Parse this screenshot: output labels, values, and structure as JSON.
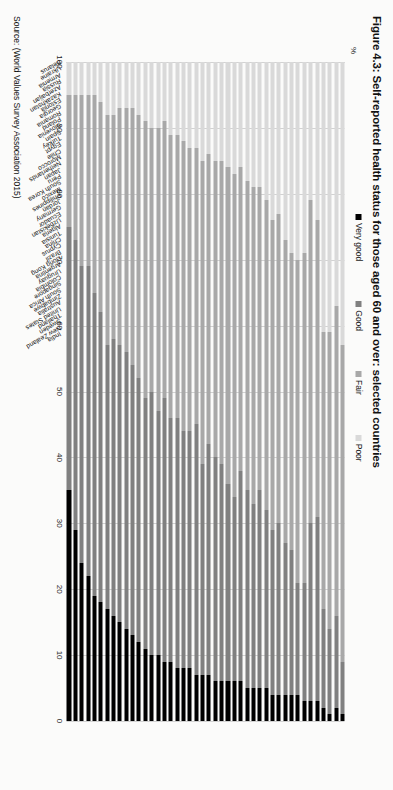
{
  "figure": {
    "title": "Figure 4.3: Self-reported health status for those aged 60 and over: selected countries",
    "source": "Source: (World Values Survey Association 2015)",
    "axis_unit_label": "%"
  },
  "legend": {
    "items": [
      {
        "label": "Very good",
        "color": "#000000"
      },
      {
        "label": "Good",
        "color": "#808080"
      },
      {
        "label": "Fair",
        "color": "#a8a8a8"
      },
      {
        "label": "Poor",
        "color": "#d9d9d9"
      }
    ]
  },
  "chart_data": {
    "type": "bar",
    "orientation": "horizontal-stacked-100",
    "title": "Figure 4.3: Self-reported health status for those aged 60 and over: selected countries",
    "xlabel": "%",
    "ylabel": "",
    "xlim": [
      0,
      100
    ],
    "xticks": [
      100,
      90,
      80,
      70,
      60,
      50,
      40,
      30,
      20,
      10,
      0
    ],
    "x_axis_direction": "reversed",
    "grid": true,
    "legend_position": "top",
    "categories": [
      "Belarus",
      "Ukraine",
      "Armenia",
      "Russia",
      "Azerbaijan",
      "Kazakhstan",
      "Estonia",
      "Georgia",
      "Romania",
      "Poland",
      "Slovenia",
      "Spain",
      "Turkey",
      "Egypt",
      "Chile",
      "Morocco",
      "Netherlands",
      "Japan",
      "Peru",
      "South Korea",
      "Mexico",
      "Philippines",
      "Jordan",
      "Germany",
      "Ecuador",
      "Uzbekistan",
      "Algeria",
      "Tunisia",
      "China",
      "Cyprus",
      "Brazil",
      "Hong Kong",
      "Argentina",
      "Uruguay",
      "Colombia",
      "Singapore",
      "South Africa",
      "Zimbabwe",
      "Australia",
      "United States",
      "Thailand",
      "Sweden",
      "New Zealand",
      "India"
    ],
    "series": [
      {
        "name": "Very good",
        "color": "#000000",
        "values": [
          1,
          2,
          1,
          2,
          3,
          3,
          3,
          4,
          4,
          4,
          4,
          4,
          5,
          5,
          5,
          5,
          6,
          6,
          6,
          6,
          6,
          7,
          7,
          7,
          8,
          8,
          8,
          9,
          9,
          10,
          10,
          11,
          12,
          13,
          14,
          15,
          16,
          17,
          18,
          19,
          22,
          24,
          29,
          35
        ]
      },
      {
        "name": "Good",
        "color": "#808080",
        "values": [
          8,
          14,
          13,
          15,
          28,
          27,
          18,
          17,
          22,
          23,
          26,
          25,
          27,
          30,
          28,
          30,
          32,
          28,
          30,
          33,
          34,
          35,
          32,
          38,
          36,
          36,
          38,
          37,
          40,
          37,
          40,
          38,
          40,
          41,
          42,
          42,
          42,
          40,
          44,
          46,
          47,
          45,
          44,
          40
        ]
      },
      {
        "name": "Fair",
        "color": "#a8a8a8",
        "values": [
          48,
          47,
          45,
          42,
          45,
          49,
          50,
          49,
          45,
          46,
          47,
          47,
          47,
          46,
          48,
          47,
          46,
          49,
          48,
          46,
          45,
          44,
          46,
          42,
          43,
          44,
          43,
          43,
          42,
          43,
          40,
          42,
          40,
          39,
          37,
          36,
          34,
          35,
          32,
          30,
          26,
          26,
          22,
          20
        ]
      },
      {
        "name": "Poor",
        "color": "#d9d9d9",
        "values": [
          43,
          37,
          41,
          41,
          24,
          21,
          29,
          30,
          29,
          27,
          23,
          24,
          21,
          19,
          19,
          18,
          16,
          17,
          16,
          15,
          15,
          14,
          15,
          13,
          13,
          12,
          11,
          11,
          9,
          10,
          10,
          9,
          8,
          7,
          7,
          7,
          8,
          8,
          6,
          5,
          5,
          5,
          5,
          5
        ]
      }
    ]
  }
}
